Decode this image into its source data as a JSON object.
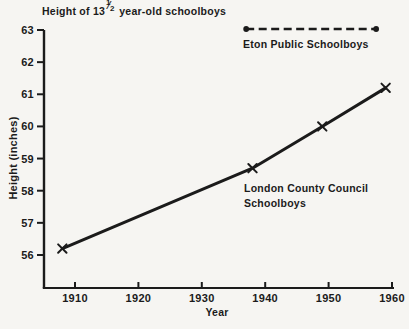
{
  "figure": {
    "ink": "#1b1b1b",
    "background": "#f6f5f2",
    "title_parts": {
      "pre": "Height of 13",
      "frac_num": "1",
      "frac_sep": "⁄",
      "frac_den": "2",
      "post": " year-old schoolboys"
    }
  },
  "chart_data": {
    "type": "line",
    "xlabel": "Year",
    "ylabel": "Height (inches)",
    "xlim": [
      1905,
      1961
    ],
    "ylim": [
      54.9,
      63
    ],
    "x_ticks": [
      1910,
      1920,
      1930,
      1940,
      1950,
      1960
    ],
    "y_ticks": [
      56,
      57,
      58,
      59,
      60,
      61,
      62,
      63
    ],
    "grid": false,
    "legend_position": "inline-annotations",
    "series": [
      {
        "name": "London County Council Schoolboys",
        "label_lines": [
          "London County Council",
          "Schoolboys"
        ],
        "line_style": "solid",
        "marker": "x",
        "color": "#1b1b1b",
        "points": [
          [
            1908,
            56.2
          ],
          [
            1938,
            58.7
          ],
          [
            1949,
            60.0
          ],
          [
            1959,
            61.2
          ]
        ]
      },
      {
        "name": "Eton Public Schoolboys",
        "line_style": "dashed",
        "marker": "dot-ends",
        "color": "#1b1b1b",
        "value": 63.0,
        "x_span": [
          1937,
          1957.5
        ]
      }
    ]
  }
}
